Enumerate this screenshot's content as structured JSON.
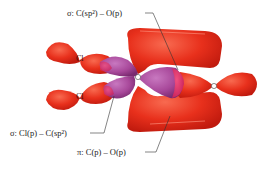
{
  "diagram": {
    "labels": {
      "sigma_co": "σ: C(sp²) – O(p)",
      "sigma_clc": "σ: Cl(p) – C(sp²)",
      "pi_co": "π: C(p) – O(p)"
    },
    "atoms": {
      "cl_top": "Cl",
      "cl_bottom": "Cl"
    },
    "colors": {
      "red_lobe": "#e8301c",
      "red_dark": "#c81e10",
      "purple_lobe": "#a8489a",
      "magenta_lobe": "#d8307a",
      "leader_line": "#333333",
      "label_text": "#222222"
    }
  }
}
